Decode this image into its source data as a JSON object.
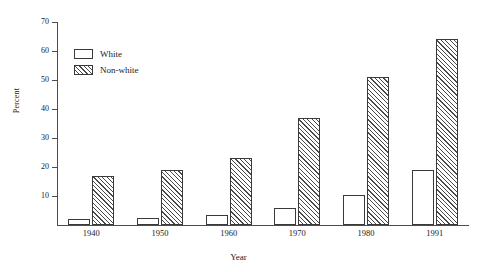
{
  "chart_data": {
    "type": "bar",
    "title": "",
    "xlabel": "Year",
    "ylabel": "Percent",
    "categories": [
      "1940",
      "1950",
      "1960",
      "1970",
      "1980",
      "1991"
    ],
    "series": [
      {
        "name": "White",
        "values": [
          2,
          2.5,
          3.5,
          6,
          10.5,
          19
        ]
      },
      {
        "name": "Non-white",
        "values": [
          17,
          19,
          23,
          37,
          51,
          64
        ]
      }
    ],
    "ylim": [
      0,
      70
    ],
    "yticks": [
      10,
      20,
      30,
      40,
      50,
      60,
      70
    ],
    "ytick_labels": [
      "10",
      "20",
      "30",
      "40",
      "50",
      "60",
      "70"
    ],
    "grid": false,
    "legend_position": "upper-left-inside",
    "legend": [
      {
        "label": "White",
        "style": "open-box"
      },
      {
        "label": "Non-white",
        "style": "diagonal-hatch-box"
      }
    ],
    "colors": {
      "axis": "#4d4d4d",
      "bar_outline": "#3a3a3a",
      "white_fill": "#ffffff",
      "hatch_line": "#4a4a4a",
      "text": "#1a1a1a",
      "background": "#ffffff"
    }
  }
}
